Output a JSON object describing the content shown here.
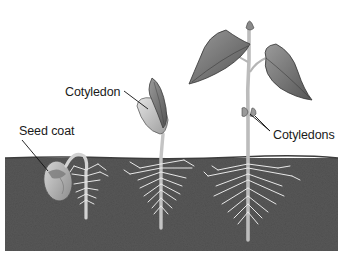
{
  "diagram": {
    "stages": [
      {
        "id": "germinating-seed",
        "description": "Seed in soil with emerging root"
      },
      {
        "id": "young-seedling",
        "description": "Hook straightening with cotyledon above soil"
      },
      {
        "id": "young-plant",
        "description": "Plant with true leaves and shrunken cotyledons"
      }
    ],
    "labels": [
      {
        "text": "Seed coat",
        "x": 7,
        "y": 121
      },
      {
        "text": "Cotyledon",
        "x": 65,
        "y": 82
      },
      {
        "text": "Cotyledons",
        "x": 273,
        "y": 127
      }
    ],
    "colors": {
      "soil": "#5a5a5a",
      "soil_dark": "#474747",
      "roots": "#e8e8e8",
      "leaf": "#6e6e6e",
      "stem": "#bdbdbd",
      "text": "#1a1a1a",
      "background": "#ffffff"
    }
  }
}
